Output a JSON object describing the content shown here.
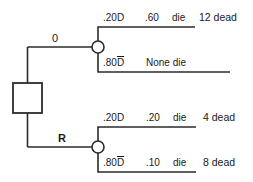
{
  "diagram": {
    "type": "decision-tree",
    "stroke_color": "#2b2b2b",
    "text_color": "#1a1a1a",
    "background": "#ffffff",
    "decision_node": {
      "shape": "square",
      "label": ""
    },
    "branches": [
      {
        "id": "upper",
        "label": "0",
        "label_sub": "",
        "chance_node": {
          "shape": "circle"
        },
        "outcomes": [
          {
            "id": "upper-top",
            "probability": ".20D",
            "overbar": false,
            "conditional": ".60",
            "event": "die",
            "result": "12 dead"
          },
          {
            "id": "upper-bottom",
            "probability": ".80D",
            "overbar": true,
            "conditional": "",
            "event": "None die",
            "result": ""
          }
        ]
      },
      {
        "id": "lower",
        "label": "R",
        "label_sub": "",
        "chance_node": {
          "shape": "circle"
        },
        "outcomes": [
          {
            "id": "lower-top",
            "probability": ".20D",
            "overbar": false,
            "conditional": ".20",
            "event": "die",
            "result": "4 dead"
          },
          {
            "id": "lower-bottom",
            "probability": ".80D",
            "overbar": true,
            "conditional": ".10",
            "event": "die",
            "result": "8 dead"
          }
        ]
      }
    ]
  }
}
